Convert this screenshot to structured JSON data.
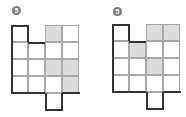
{
  "figures": [
    {
      "label": "5",
      "origin": [
        11,
        25
      ],
      "cell_size": 17,
      "cells": [
        {
          "r": 0,
          "c": 0,
          "shaded": false
        },
        {
          "r": 0,
          "c": 2,
          "shaded": true
        },
        {
          "r": 0,
          "c": 3,
          "shaded": false
        },
        {
          "r": 1,
          "c": 0,
          "shaded": false
        },
        {
          "r": 1,
          "c": 1,
          "shaded": false
        },
        {
          "r": 1,
          "c": 2,
          "shaded": false
        },
        {
          "r": 1,
          "c": 3,
          "shaded": false
        },
        {
          "r": 2,
          "c": 0,
          "shaded": false
        },
        {
          "r": 2,
          "c": 1,
          "shaded": false
        },
        {
          "r": 2,
          "c": 2,
          "shaded": true
        },
        {
          "r": 2,
          "c": 3,
          "shaded": true
        },
        {
          "r": 3,
          "c": 0,
          "shaded": false
        },
        {
          "r": 3,
          "c": 1,
          "shaded": false
        },
        {
          "r": 3,
          "c": 2,
          "shaded": false
        },
        {
          "r": 3,
          "c": 3,
          "shaded": true
        },
        {
          "r": 4,
          "c": 2,
          "shaded": false
        }
      ]
    },
    {
      "label": "5",
      "origin": [
        112,
        24
      ],
      "cell_size": 17,
      "cells": [
        {
          "r": 0,
          "c": 0,
          "shaded": false
        },
        {
          "r": 0,
          "c": 2,
          "shaded": true
        },
        {
          "r": 0,
          "c": 3,
          "shaded": true
        },
        {
          "r": 1,
          "c": 0,
          "shaded": false
        },
        {
          "r": 1,
          "c": 1,
          "shaded": true
        },
        {
          "r": 1,
          "c": 2,
          "shaded": false
        },
        {
          "r": 1,
          "c": 3,
          "shaded": false
        },
        {
          "r": 2,
          "c": 0,
          "shaded": false
        },
        {
          "r": 2,
          "c": 1,
          "shaded": false
        },
        {
          "r": 2,
          "c": 2,
          "shaded": true
        },
        {
          "r": 2,
          "c": 3,
          "shaded": false
        },
        {
          "r": 3,
          "c": 0,
          "shaded": false
        },
        {
          "r": 3,
          "c": 1,
          "shaded": false
        },
        {
          "r": 3,
          "c": 2,
          "shaded": false
        },
        {
          "r": 3,
          "c": 3,
          "shaded": false
        },
        {
          "r": 4,
          "c": 2,
          "shaded": false
        }
      ]
    }
  ],
  "colors": {
    "shaded": "#dcdcdc",
    "grid": "#a8a8a8",
    "outline": "#333333",
    "badge": "#7a7a7a"
  }
}
